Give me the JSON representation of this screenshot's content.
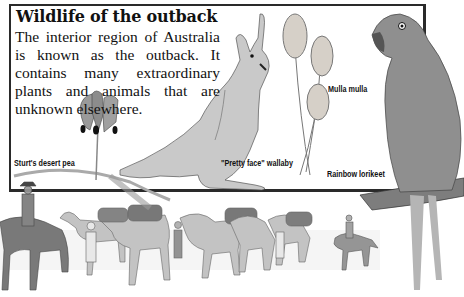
{
  "page": {
    "title": "Wildlife of the outback",
    "body": "The interior region of Australia is known as the outback. It contains many extraordinary plants and animals that are unknown elsewhere."
  },
  "labels": {
    "desert_pea": "Sturt's desert pea",
    "wallaby": "\"Pretty face\" wallaby",
    "mulla_mulla": "Mulla mulla",
    "lorikeet": "Rainbow lorikeet"
  },
  "illustrations": [
    "Sturt's desert pea flower",
    "Pretty face wallaby",
    "Mulla mulla plant",
    "Rainbow lorikeet on branch",
    "Camel caravan with riders and handlers"
  ]
}
